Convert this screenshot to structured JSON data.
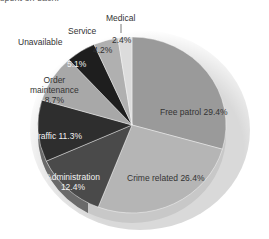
{
  "caption": "spent on each.",
  "chart_data": {
    "type": "pie",
    "title": "",
    "categories": [
      "Free patrol",
      "Crime related",
      "Administration",
      "Traffic",
      "Order maintenance",
      "Unavailable",
      "Service",
      "Medical"
    ],
    "values": [
      29.4,
      26.4,
      12.4,
      11.3,
      8.7,
      5.1,
      4.2,
      2.4
    ],
    "labels": {
      "free_patrol": "Free patrol 29.4%",
      "crime_related": "Crime related 26.4%",
      "administration_name": "Administration",
      "administration_value": "12.4%",
      "traffic": "Traffic 11.3%",
      "order_name_1": "Order",
      "order_name_2": "maintenance",
      "order_value": "8.7%",
      "unavailable_name": "Unavailable",
      "unavailable_value": "5.1%",
      "service_name": "Service",
      "service_value": "4.2%",
      "medical_name": "Medical",
      "medical_value": "2.4%"
    },
    "colors": {
      "free_patrol": "#9a9a9a",
      "crime_related": "#b5b5b5",
      "administration": "#4a4a4a",
      "traffic": "#2e2e2e",
      "order_maintenance": "#a8a8a8",
      "unavailable": "#1e1e1e",
      "service": "#b0b0b0",
      "medical": "#dcdcdc"
    },
    "legend": "none (direct labels)",
    "style": "3D tilted pie"
  }
}
